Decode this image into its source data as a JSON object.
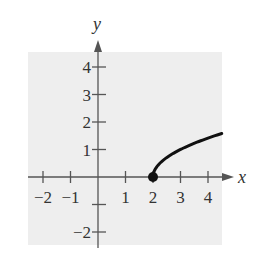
{
  "chart_data": {
    "type": "line",
    "title": "",
    "xlabel": "x",
    "ylabel": "y",
    "xlim": [
      -2.5,
      4.5
    ],
    "ylim": [
      -2.5,
      4.5
    ],
    "grid": false,
    "background_color": "#eeeeee",
    "x_ticks": [
      -2,
      -1,
      1,
      2,
      3,
      4
    ],
    "x_tick_labels": [
      "−2",
      "−1",
      "1",
      "2",
      "3",
      "4"
    ],
    "y_ticks": [
      4,
      3,
      2,
      1,
      -1,
      -2
    ],
    "y_tick_labels": [
      "4",
      "3",
      "2",
      "1",
      "",
      "−2"
    ],
    "series": [
      {
        "name": "y = sqrt(x - 2)",
        "x": [
          2,
          2.25,
          2.5,
          3,
          3.5,
          4,
          4.5
        ],
        "y": [
          0,
          0.5,
          0.71,
          1,
          1.22,
          1.41,
          1.58
        ],
        "color": "#111111"
      }
    ],
    "annotations": [
      {
        "type": "closed-point",
        "x": 2,
        "y": 0
      }
    ]
  }
}
